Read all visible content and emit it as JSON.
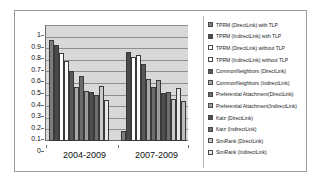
{
  "chart_data": {
    "type": "bar",
    "title": "",
    "xlabel": "",
    "ylabel": "",
    "ylim": [
      0,
      1
    ],
    "ytick_labels": [
      "1",
      "0.9",
      "0.8",
      "0.7",
      "0.6",
      "0.5",
      "0.4",
      "0.3",
      "0.2",
      "0.1",
      "0"
    ],
    "grid": true,
    "legend_position": "right",
    "categories": [
      "2004-2009",
      "2007-2009"
    ],
    "series": [
      {
        "name": "TPRM (DirectLink) with TLP",
        "color": "#7d7d7d",
        "values": [
          0.87,
          0.09
        ]
      },
      {
        "name": "TPRM (IndirectLink) with TLP",
        "color": "#4a4a4a",
        "values": [
          0.83,
          0.77
        ]
      },
      {
        "name": "TPRM (DirectLink) without TLP",
        "color": "#ffffff",
        "values": [
          0.755,
          0.725
        ]
      },
      {
        "name": "TPRM (IndirectLink) without TLP",
        "color": "#fbfbfb",
        "values": [
          0.69,
          0.74
        ]
      },
      {
        "name": "CommonNeighbors (DirectLink)",
        "color": "#595959",
        "values": [
          0.6,
          0.665
        ]
      },
      {
        "name": "CommonNeighbors (IndirectLink)",
        "color": "#a8a8a8",
        "values": [
          0.465,
          0.535
        ]
      },
      {
        "name": "Preferential Attachment(DirectLink)",
        "color": "#6b6b6b",
        "values": [
          0.56,
          0.465
        ]
      },
      {
        "name": "Preferential Attachment(IndirectLink)",
        "color": "#9d9d9d",
        "values": [
          0.43,
          0.53
        ]
      },
      {
        "name": "Katz (DirectLink)",
        "color": "#4f4f4f",
        "values": [
          0.42,
          0.415
        ]
      },
      {
        "name": "Katz (IndirectLink)",
        "color": "#6f6f6f",
        "values": [
          0.395,
          0.42
        ]
      },
      {
        "name": "SimRank (DirectLink)",
        "color": "#c9c9c9",
        "values": [
          0.47,
          0.365
        ]
      },
      {
        "name": "SimRank (IndirectLink)",
        "color": "#e8e8e8",
        "values": [
          0.35,
          0.46
        ]
      }
    ],
    "extra_series_group2": [
      {
        "name": "SimRank (IndirectLink) tail",
        "color": "#bdbdbd",
        "values": [
          null,
          0.345
        ]
      }
    ]
  }
}
